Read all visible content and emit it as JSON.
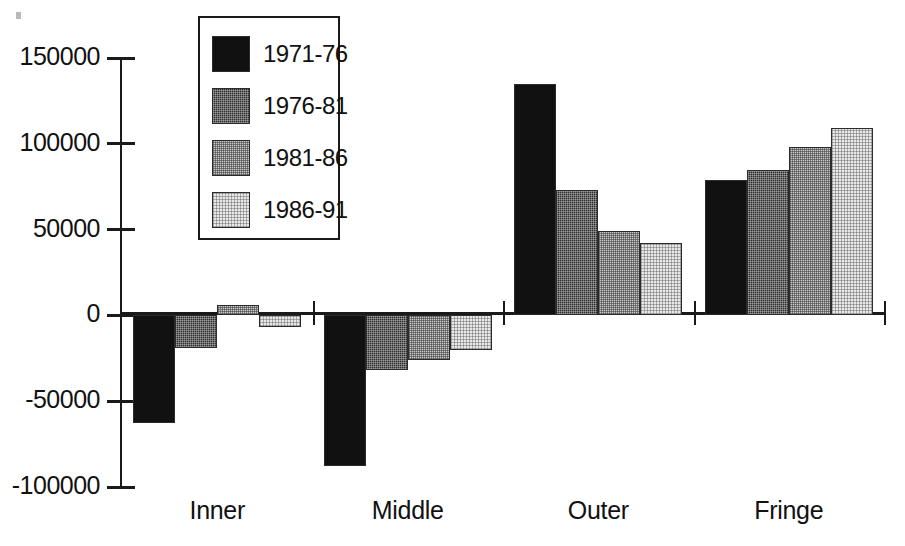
{
  "chart_data": {
    "type": "bar",
    "title": "",
    "subtitle": "",
    "xlabel": "",
    "ylabel": "",
    "categories": [
      "Inner",
      "Middle",
      "Outer",
      "Fringe"
    ],
    "series": [
      {
        "name": "1971-76",
        "color": "#111111",
        "values": [
          -63000,
          -88000,
          135000,
          79000
        ]
      },
      {
        "name": "1976-81",
        "color": "#2e2e2e",
        "values": [
          -19000,
          -32000,
          73000,
          85000
        ]
      },
      {
        "name": "1981-86",
        "color": "#c9c9c9",
        "values": [
          6000,
          -26000,
          49000,
          98000
        ]
      },
      {
        "name": "1986-91",
        "color": "#e8e8e8",
        "values": [
          -7000,
          -20000,
          42000,
          109000
        ]
      }
    ],
    "ylim": [
      -100000,
      150000
    ],
    "yticks": [
      150000,
      100000,
      50000,
      0,
      -50000,
      -100000
    ],
    "ytick_labels": [
      "150000",
      "100000",
      "50000",
      "0",
      "-50000",
      "-100000"
    ],
    "grid": false,
    "legend_position": "top-left-inside",
    "legend_entries": [
      "1971-76",
      "1976-81",
      "1981-86",
      "1986-91"
    ]
  },
  "axis": {
    "y_tick_labels": [
      "150000",
      "100000",
      "50000",
      "0",
      "-50000",
      "-100000"
    ],
    "x_tick_labels": [
      "Inner",
      "Middle",
      "Outer",
      "Fringe"
    ]
  },
  "legend": {
    "items": [
      {
        "label": "1971-76"
      },
      {
        "label": "1976-81"
      },
      {
        "label": "1981-86"
      },
      {
        "label": "1986-91"
      }
    ]
  }
}
